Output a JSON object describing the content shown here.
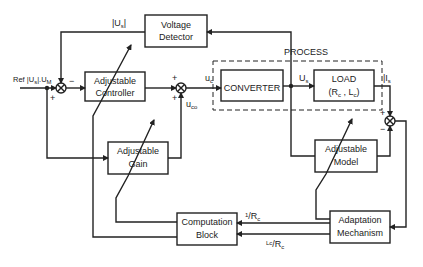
{
  "diagram": {
    "type": "block-diagram",
    "blocks": {
      "voltage_detector": {
        "line1": "Voltage",
        "line2": "Detector"
      },
      "adjustable_controller": {
        "line1": "Adjustable",
        "line2": "Controller"
      },
      "converter": {
        "line1": "CONVERTER"
      },
      "load": {
        "line1": "LOAD",
        "line2": "(R",
        "line2_sub1": "c",
        "line2_mid": " , L",
        "line2_sub2": "c",
        "line2_end": ")"
      },
      "adjustable_gain": {
        "line1": "Adjustable",
        "line2": "Gain"
      },
      "adjustable_model": {
        "line1": "Adjustable",
        "line2": "Model"
      },
      "computation_block": {
        "line1": "Computation",
        "line2": "Block"
      },
      "adaptation_mechanism": {
        "line1": "Adaptation",
        "line2": "Mechanism"
      }
    },
    "group": {
      "process_label": "PROCESS"
    },
    "signals": {
      "us_abs": "|U",
      "us_abs_sub": "s",
      "ref": "Ref |U",
      "ref_sub": "s",
      "ref_mid": "|.U",
      "ref_sub2": "M",
      "uc": "u",
      "uc_sub": "c",
      "uco": "u",
      "uco_sub": "co",
      "us": "U",
      "us_sub": "s",
      "is": "I",
      "is_sub": "s",
      "inv_rc_num": "1",
      "inv_rc_den": "R",
      "inv_rc_den_sub": "c",
      "lc_rc_num": "L",
      "lc_rc_num_sub": "c",
      "lc_rc_den": "R",
      "lc_rc_den_sub": "c"
    },
    "junction_signs": {
      "sum1_top": "−",
      "sum1_bottom": "+",
      "sum2_top": "+",
      "sum2_bottom": "+",
      "sum3_top": "+",
      "sum3_bottom": "−"
    }
  }
}
